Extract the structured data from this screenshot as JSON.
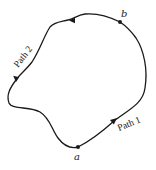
{
  "diagram": {
    "type": "closed-curve-paths",
    "points": [
      {
        "id": "a",
        "label": "a",
        "x": 78,
        "y": 147
      },
      {
        "id": "b",
        "label": "b",
        "x": 120,
        "y": 22
      }
    ],
    "paths": [
      {
        "id": "path1",
        "label": "Path 1",
        "from": "a",
        "to": "b",
        "direction": "counterclockwise-right-side"
      },
      {
        "id": "path2",
        "label": "Path 2",
        "from": "b",
        "to": "a",
        "direction": "over-top-and-left-side"
      }
    ],
    "colors": {
      "stroke": "#1a1a1a",
      "background": "#ffffff"
    }
  }
}
